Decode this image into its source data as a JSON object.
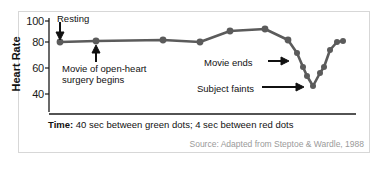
{
  "figure": {
    "frame_color": "#d7d7d7",
    "background": "#ffffff"
  },
  "axes": {
    "y_title": "Heart Rate",
    "y_ticks": [
      "100",
      "80",
      "60",
      "40"
    ],
    "y_tick_values": [
      100,
      80,
      60,
      40
    ]
  },
  "annotations": {
    "resting": "Resting",
    "movie_start_line1": "Movie of open-heart",
    "movie_start_line2": "surgery begins",
    "movie_ends": "Movie ends",
    "subject_faints": "Subject faints",
    "arrow_right": "→",
    "arrow_down": "↓",
    "arrow_up": "↑"
  },
  "caption": {
    "label": "Time:",
    "text": " 40 sec between green dots; 4 sec between red dots"
  },
  "source": {
    "text": "Source: Adapted from Steptoe & Wardle, 1988"
  },
  "chart_data": {
    "type": "line",
    "title": "",
    "xlabel": "Time: 40 sec between green dots; 4 sec between red dots",
    "ylabel": "Heart Rate",
    "ylim": [
      30,
      105
    ],
    "yticks": [
      40,
      60,
      80,
      100
    ],
    "grid": false,
    "legend": false,
    "note": "Heart rate of a single subject watching a film of open-heart surgery; green (wide-spaced) dots are 40 s apart, red (close-spaced) dots are 4 s apart.",
    "series": [
      {
        "name": "Heart Rate (bpm)",
        "color": "#5b5b5b",
        "points": [
          {
            "x": 0,
            "y": 81,
            "marker": "green",
            "px": 60,
            "py": 42
          },
          {
            "x": 40,
            "y": 82,
            "marker": "green",
            "px": 96,
            "py": 41
          },
          {
            "x": 80,
            "y": 83,
            "marker": "green",
            "px": 163,
            "py": 40
          },
          {
            "x": 120,
            "y": 82,
            "marker": "green",
            "px": 200,
            "py": 42
          },
          {
            "x": 160,
            "y": 90,
            "marker": "green",
            "px": 230,
            "py": 31
          },
          {
            "x": 200,
            "y": 92,
            "marker": "green",
            "px": 265,
            "py": 29
          },
          {
            "x": 240,
            "y": 83,
            "marker": "green",
            "px": 288,
            "py": 40
          },
          {
            "x": 244,
            "y": 73,
            "marker": "red",
            "px": 297,
            "py": 53
          },
          {
            "x": 248,
            "y": 62,
            "marker": "red",
            "px": 303,
            "py": 67
          },
          {
            "x": 252,
            "y": 55,
            "marker": "red",
            "px": 307,
            "py": 76
          },
          {
            "x": 256,
            "y": 47,
            "marker": "red",
            "px": 313,
            "py": 86
          },
          {
            "x": 260,
            "y": 57,
            "marker": "red",
            "px": 320,
            "py": 73
          },
          {
            "x": 264,
            "y": 62,
            "marker": "red",
            "px": 324,
            "py": 67
          },
          {
            "x": 268,
            "y": 75,
            "marker": "red",
            "px": 330,
            "py": 50
          },
          {
            "x": 272,
            "y": 82,
            "marker": "red",
            "px": 337,
            "py": 42
          },
          {
            "x": 276,
            "y": 83,
            "marker": "red",
            "px": 343,
            "py": 41
          }
        ]
      }
    ],
    "events": [
      {
        "label": "Resting",
        "at_x": 0
      },
      {
        "label": "Movie of open-heart surgery begins",
        "at_x": 40
      },
      {
        "label": "Movie ends",
        "at_x": 240
      },
      {
        "label": "Subject faints",
        "at_x": 256
      }
    ]
  }
}
